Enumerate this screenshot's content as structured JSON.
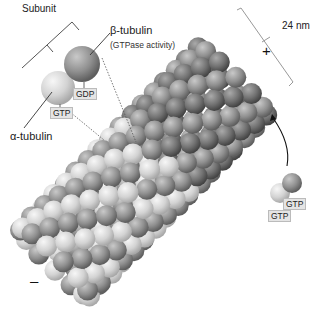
{
  "labels": {
    "subunit": "Subunit",
    "beta_tubulin": "β-tubulin",
    "gtpase": "(GTPase activity)",
    "alpha_tubulin": "α-tubulin",
    "gdp": "GDP",
    "gtp": "GTP",
    "free_gtp_top": "GTP",
    "free_gtp_bottom": "GTP",
    "diameter": "24 nm",
    "plus_end": "+",
    "minus_end": "–"
  },
  "colors": {
    "alpha": "#d6d6d6",
    "beta": "#8e8e8e",
    "beta_cap": "#6e6e6e",
    "line": "#444444",
    "bracket": "#999999"
  },
  "tube": {
    "axis_start": [
      55,
      262
    ],
    "axis_end": [
      232,
      82
    ],
    "radius": 62,
    "rings": 17,
    "per_ring": 13,
    "sphere_r": 10.5
  }
}
